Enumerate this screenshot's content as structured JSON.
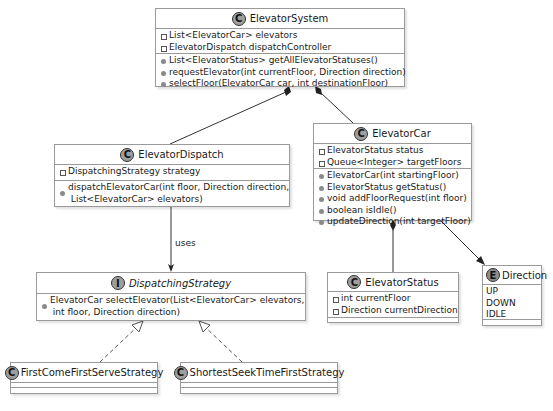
{
  "diagram": {
    "type": "uml-class-diagram",
    "classes": {
      "elevator_system": {
        "stereotype": "C",
        "name": "ElevatorSystem",
        "attributes": [
          "List<ElevatorCar> elevators",
          "ElevatorDispatch dispatchController"
        ],
        "methods": [
          "List<ElevatorStatus> getAllElevatorStatuses()",
          "requestElevator(int currentFloor, Direction direction)",
          "selectFloor(ElevatorCar car, int destinationFloor)"
        ]
      },
      "elevator_dispatch": {
        "stereotype": "C",
        "name": "ElevatorDispatch",
        "attributes": [
          "DispatchingStrategy strategy"
        ],
        "methods": [
          "dispatchElevatorCar(int floor, Direction direction,",
          " List<ElevatorCar> elevators)"
        ]
      },
      "elevator_car": {
        "stereotype": "C",
        "name": "ElevatorCar",
        "attributes": [
          "ElevatorStatus status",
          "Queue<Integer> targetFloors"
        ],
        "methods": [
          "ElevatorCar(int startingFloor)",
          "ElevatorStatus getStatus()",
          "void addFloorRequest(int floor)",
          "boolean isIdle()",
          "updateDirection(int targetFloor)"
        ]
      },
      "dispatching_strategy": {
        "stereotype": "I",
        "name": "DispatchingStrategy",
        "methods": [
          "ElevatorCar selectElevator(List<ElevatorCar> elevators,",
          " int floor, Direction direction)"
        ]
      },
      "elevator_status": {
        "stereotype": "C",
        "name": "ElevatorStatus",
        "attributes": [
          "int currentFloor",
          "Direction currentDirection"
        ]
      },
      "direction": {
        "stereotype": "E",
        "name": "Direction",
        "literals": [
          "UP",
          "DOWN",
          "IDLE"
        ]
      },
      "fcfs": {
        "stereotype": "C",
        "name": "FirstComeFirstServeStrategy"
      },
      "sstf": {
        "stereotype": "C",
        "name": "ShortestSeekTimeFirstStrategy"
      }
    },
    "relations": {
      "uses_label": "uses",
      "list": [
        {
          "from": "ElevatorSystem",
          "to": "ElevatorDispatch",
          "kind": "composition"
        },
        {
          "from": "ElevatorSystem",
          "to": "ElevatorCar",
          "kind": "composition"
        },
        {
          "from": "ElevatorCar",
          "to": "ElevatorStatus",
          "kind": "composition"
        },
        {
          "from": "ElevatorCar",
          "to": "Direction",
          "kind": "association"
        },
        {
          "from": "ElevatorDispatch",
          "to": "DispatchingStrategy",
          "kind": "dependency",
          "label": "uses"
        },
        {
          "from": "FirstComeFirstServeStrategy",
          "to": "DispatchingStrategy",
          "kind": "realization"
        },
        {
          "from": "ShortestSeekTimeFirstStrategy",
          "to": "DispatchingStrategy",
          "kind": "realization"
        }
      ]
    }
  }
}
